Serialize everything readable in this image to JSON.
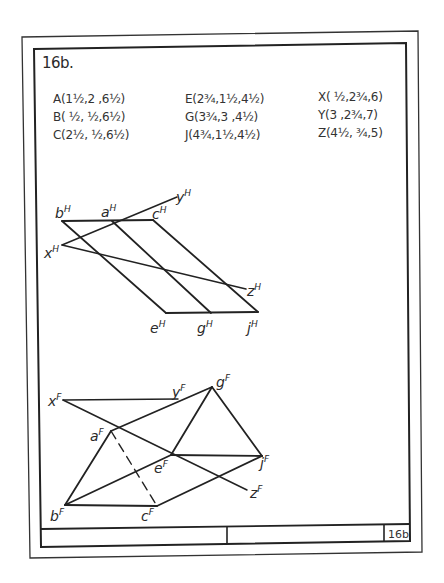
{
  "problem": {
    "title": "16b.",
    "sheet_number": "16b"
  },
  "coordinates": {
    "column1": [
      {
        "label": "A(1½,2 ,6½)"
      },
      {
        "label": "B( ½, ½,6½)"
      },
      {
        "label": "C(2½, ½,6½)"
      }
    ],
    "column2": [
      {
        "label": "E(2¾,1½,4½)"
      },
      {
        "label": "G(3¾,3 ,4½)"
      },
      {
        "label": "J(4¾,1½,4½)"
      }
    ],
    "column3": [
      {
        "label": "X( ½,2¾,6)"
      },
      {
        "label": "Y(3 ,2¾,7)"
      },
      {
        "label": "Z(4½, ¾,5)"
      }
    ]
  },
  "top_view": {
    "labels": {
      "b": "b",
      "a": "a",
      "c": "c",
      "y": "y",
      "x": "x",
      "z": "z",
      "e": "e",
      "g": "g",
      "j": "j",
      "sup": "H"
    }
  },
  "front_view": {
    "labels": {
      "x": "x",
      "y": "y",
      "g": "g",
      "a": "a",
      "e": "e",
      "j": "j",
      "z": "z",
      "b": "b",
      "c": "c",
      "sup": "F"
    }
  },
  "colors": {
    "line": "#222222",
    "paper": "#ffffff"
  }
}
